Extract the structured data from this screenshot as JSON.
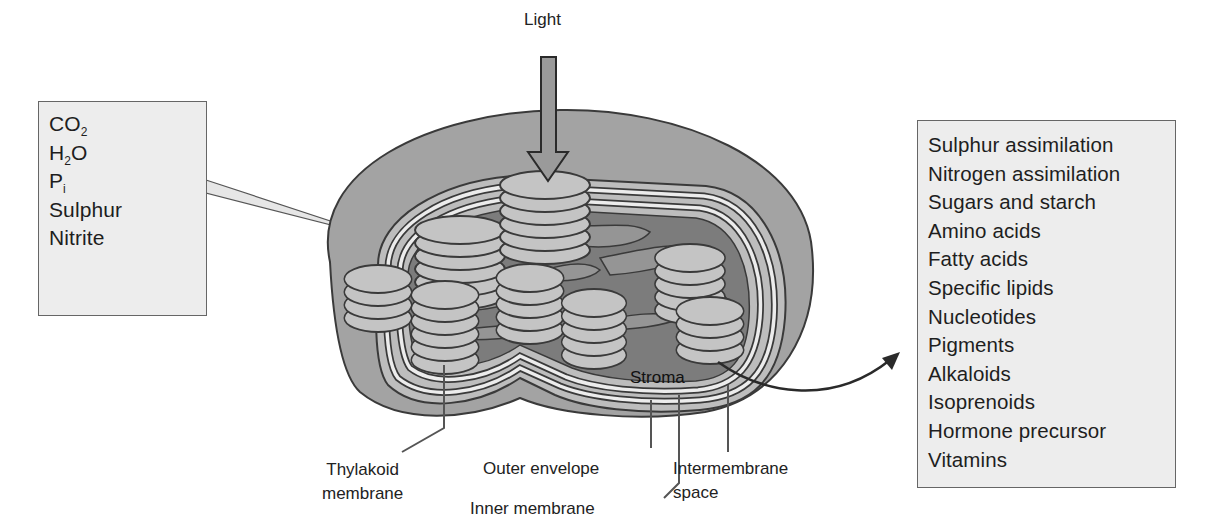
{
  "diagram": {
    "light_label": "Light",
    "stroma_label": "Stroma",
    "inputs_box": {
      "items": [
        {
          "text": "CO",
          "sub": "2",
          "after": ""
        },
        {
          "text": "H",
          "sub": "2",
          "after": "O"
        },
        {
          "text": "P",
          "sub": "i",
          "after": ""
        },
        {
          "text": "Sulphur",
          "sub": "",
          "after": ""
        },
        {
          "text": "Nitrite",
          "sub": "",
          "after": ""
        }
      ]
    },
    "outputs_box": {
      "items": [
        "Sulphur assimilation",
        "Nitrogen assimilation",
        "Sugars and starch",
        "Amino acids",
        "Fatty acids",
        "Specific lipids",
        "Nucleotides",
        "Pigments",
        "Alkaloids",
        "Isoprenoids",
        "Hormone precursor",
        "Vitamins"
      ]
    },
    "labels": {
      "thylakoid_line1": "Thylakoid",
      "thylakoid_line2": "membrane",
      "outer_envelope": "Outer envelope",
      "inner_membrane": "Inner membrane",
      "intermembrane_line1": "Intermembrane",
      "intermembrane_line2": "space"
    },
    "colors": {
      "outer_envelope": "#a3a3a3",
      "intermembrane": "#bdbdbd",
      "membrane_gap": "#e9e9e9",
      "stroma": "#7c7c7c",
      "stroma_lamellae": "#959595",
      "grana_disc": "#c4c4c4",
      "outline": "#3a3a3a",
      "box_fill": "#ededed"
    }
  }
}
